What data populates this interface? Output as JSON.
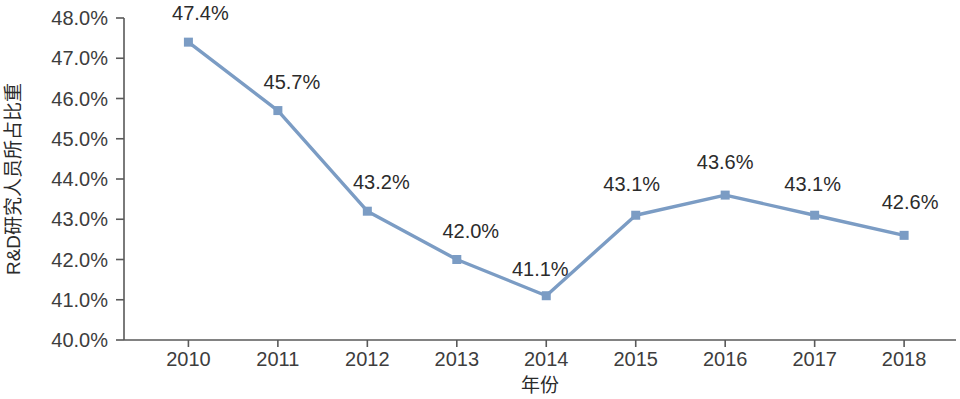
{
  "chart_data": {
    "type": "line",
    "title": "",
    "xlabel": "年份",
    "ylabel": "R&D研究人员所占比重",
    "categories": [
      "2010",
      "2011",
      "2012",
      "2013",
      "2014",
      "2015",
      "2016",
      "2017",
      "2018"
    ],
    "values": [
      47.4,
      45.7,
      43.2,
      42.0,
      41.1,
      43.1,
      43.6,
      43.1,
      42.6
    ],
    "point_labels": [
      "47.4%",
      "45.7%",
      "43.2%",
      "42.0%",
      "41.1%",
      "43.1%",
      "43.6%",
      "43.1%",
      "42.6%"
    ],
    "ylim": [
      40.0,
      48.0
    ],
    "ytick_values": [
      48.0,
      47.0,
      46.0,
      45.0,
      44.0,
      43.0,
      42.0,
      41.0,
      40.0
    ],
    "ytick_labels": [
      "48.0%",
      "47.0%",
      "46.0%",
      "45.0%",
      "44.0%",
      "43.0%",
      "42.0%",
      "41.0%",
      "40.0%"
    ],
    "grid": false,
    "legend": false,
    "series_color": "#7b9cc4",
    "marker": "square",
    "axis_color": "#595959"
  },
  "axes": {
    "y_title": "R&D研究人员所占比重",
    "x_title": "年份"
  }
}
